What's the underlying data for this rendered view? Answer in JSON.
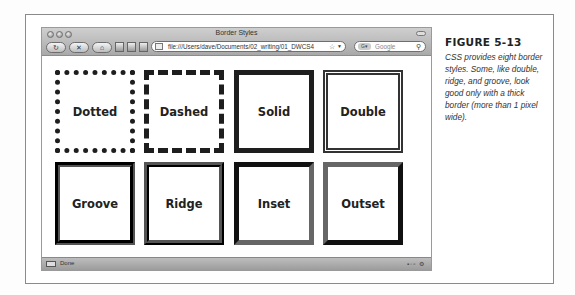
{
  "window": {
    "title": "Border Styles"
  },
  "toolbar": {
    "buttons": [
      {
        "name": "reload",
        "glyph": "↻"
      },
      {
        "name": "stop",
        "glyph": "✕"
      },
      {
        "name": "home",
        "glyph": "⌂"
      }
    ],
    "url": "file:///Users/dave/Documents/02_writing/01_DWCS4",
    "url_star_glyph": "☆",
    "url_caret_glyph": "▼",
    "search_engine_label": "G▾",
    "search_placeholder": "Google",
    "search_glyph": "⚲"
  },
  "boxes": [
    {
      "label": "Dotted",
      "style": "dotted"
    },
    {
      "label": "Dashed",
      "style": "dashed"
    },
    {
      "label": "Solid",
      "style": "solid"
    },
    {
      "label": "Double",
      "style": "double"
    },
    {
      "label": "Groove",
      "style": "groove"
    },
    {
      "label": "Ridge",
      "style": "ridge"
    },
    {
      "label": "Inset",
      "style": "inset"
    },
    {
      "label": "Outset",
      "style": "outset"
    }
  ],
  "statusbar": {
    "text": "Done",
    "tray": "▪◦▫ ⚙"
  },
  "caption": {
    "title": "FIGURE 5-13",
    "body": "CSS provides eight border styles. Some, like double, ridge, and groove, look good only with a thick border (more than 1 pixel wide)."
  }
}
